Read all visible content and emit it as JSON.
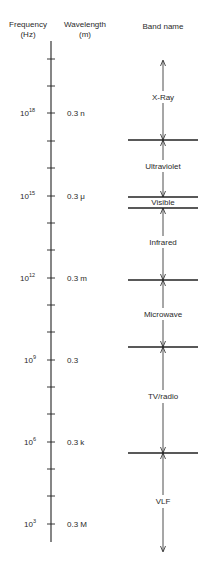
{
  "headers": {
    "frequency": {
      "line1": "Frequency",
      "line2": "(Hz)"
    },
    "wavelength": {
      "line1": "Wavelength",
      "line2": "(m)"
    },
    "band": {
      "line1": "Band name"
    }
  },
  "colors": {
    "ink": "#222222",
    "background": "#ffffff"
  },
  "axis": {
    "top_y": 41,
    "bottom_y": 542,
    "x": 51,
    "tick_decades": [
      20,
      19,
      18,
      17,
      16,
      15,
      14,
      13,
      12,
      11,
      10,
      9,
      8,
      7,
      6,
      5,
      4,
      3
    ],
    "labeled_ticks": [
      {
        "base": "10",
        "exp": "18",
        "wavelength": "0.3 n"
      },
      {
        "base": "10",
        "exp": "15",
        "wavelength": "0.3 μ"
      },
      {
        "base": "10",
        "exp": "12",
        "wavelength": "0.3 m"
      },
      {
        "base": "10",
        "exp": "9",
        "wavelength": "0.3"
      },
      {
        "base": "10",
        "exp": "6",
        "wavelength": "0.3 k"
      },
      {
        "base": "10",
        "exp": "3",
        "wavelength": "0.3 M"
      }
    ]
  },
  "bands": [
    {
      "name": "X-Ray"
    },
    {
      "name": "Ultraviolet"
    },
    {
      "name": "Visible"
    },
    {
      "name": "Infrared"
    },
    {
      "name": "Microwave"
    },
    {
      "name": "TV/radio"
    },
    {
      "name": "VLF"
    }
  ]
}
